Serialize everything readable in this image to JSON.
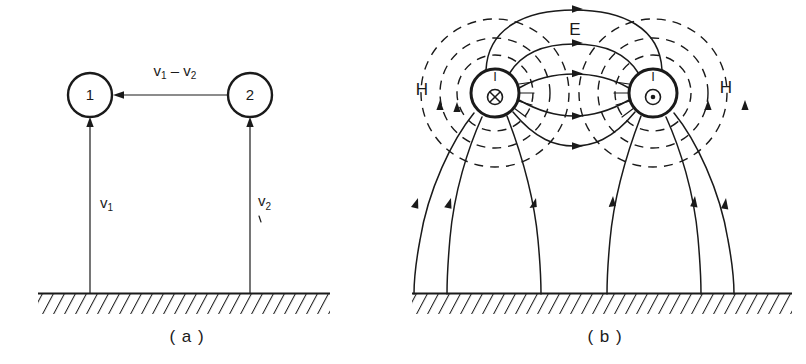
{
  "figure": {
    "background_color": "#ffffff",
    "ink_color": "#1a1a1a",
    "width": 806,
    "height": 364
  },
  "panel_a": {
    "caption": "( a )",
    "nodes": [
      {
        "label": "1",
        "name": "conductor-1"
      },
      {
        "label": "2",
        "name": "conductor-2"
      }
    ],
    "differential_label": {
      "base_1": "v",
      "sub_1": "1",
      "operator": "–",
      "base_2": "v",
      "sub_2": "2",
      "full": "v1 - v2"
    },
    "voltage_labels": [
      {
        "base": "v",
        "sub": "1",
        "full": "v1",
        "name": "voltage-label-v1"
      },
      {
        "base": "v",
        "sub": "2",
        "full": "v2",
        "name": "voltage-label-v2"
      }
    ],
    "ground_name": "ground-plane"
  },
  "panel_b": {
    "caption": "( b )",
    "conductors": [
      {
        "current_label": "I",
        "direction_symbol": "circle-cross",
        "direction_meaning": "into-page",
        "name": "conductor-left"
      },
      {
        "current_label": "I",
        "direction_symbol": "circle-dot",
        "direction_meaning": "out-of-page",
        "name": "conductor-right"
      }
    ],
    "field_labels": {
      "electric": "E",
      "magnetic_left": "H",
      "magnetic_right": "H"
    },
    "ground_name": "ground-plane"
  }
}
